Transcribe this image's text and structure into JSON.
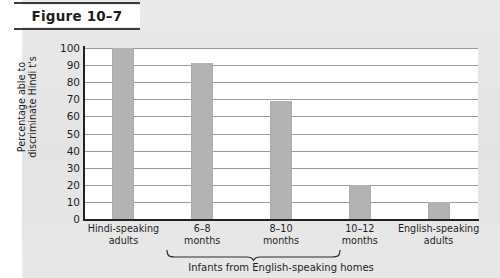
{
  "figure": {
    "label": "Figure 10–7"
  },
  "chart_data": {
    "type": "bar",
    "title": "",
    "categories": [
      "Hindi-speaking\nadults",
      "6–8\nmonths",
      "8–10\nmonths",
      "10–12\nmonths",
      "English-speaking\nadults"
    ],
    "values": [
      100,
      91,
      69,
      20,
      10
    ],
    "xlabel": "Infants from English-speaking homes",
    "ylabel": "Percentage able to\ndiscriminate Hindi t's",
    "ylim": [
      0,
      100
    ],
    "ytick_labels": [
      "100",
      "90",
      "80",
      "70",
      "60",
      "50",
      "40",
      "30",
      "20",
      "10",
      "0"
    ],
    "ytick_values": [
      100,
      90,
      80,
      70,
      60,
      50,
      40,
      30,
      20,
      10,
      0
    ],
    "grid": true,
    "legend": "none",
    "bar_color": "#b3b3b3",
    "plot_background": "#ffffff",
    "axis_color": "#222222",
    "gridline_color": "#9a9a9a",
    "group_bracket": {
      "label": "Infants from English-speaking homes",
      "spans_categories": [
        1,
        2,
        3
      ]
    }
  },
  "page": {
    "background_color": "#e7e7e7",
    "margin_color": "#ffffff"
  }
}
